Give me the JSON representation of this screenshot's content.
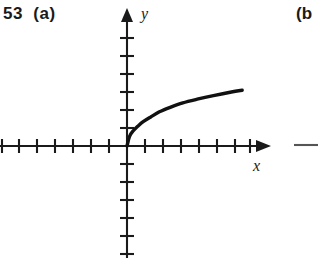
{
  "figure": {
    "problem_number": "53",
    "part_label": "(a)",
    "problem_label_text": "53  (a)",
    "next_part_label": "(b",
    "axis_x_label": "x",
    "axis_y_label": "y",
    "colors": {
      "background": "#ffffff",
      "axis": "#1a1a1a",
      "curve": "#111111",
      "text": "#1a1a1a"
    }
  },
  "chart_data": {
    "type": "line",
    "title": "53 (a)",
    "subtitle": "",
    "xlabel": "x",
    "ylabel": "y",
    "grid": false,
    "legend": null,
    "axis_style": "arrowed-cartesian-axes-with-unit-ticks",
    "origin_px": [
      127,
      146
    ],
    "unit_px": 18,
    "xlim": [
      -7,
      7.5
    ],
    "ylim": [
      -6,
      7.5
    ],
    "x_tick_count_negative": 7,
    "x_tick_count_positive": 7,
    "y_tick_count_positive": 7,
    "y_tick_count_negative": 6,
    "tick_labels_shown": false,
    "series": [
      {
        "name": "y = sqrt(x)",
        "description": "square root curve starting at the origin, increasing and concave down",
        "x": [
          0,
          0.15,
          0.35,
          0.6,
          0.9,
          1.3,
          1.8,
          2.4,
          3.1,
          3.9,
          4.8,
          5.8,
          6.4
        ],
        "y": [
          0,
          0.55,
          0.85,
          1.1,
          1.35,
          1.6,
          1.9,
          2.15,
          2.4,
          2.6,
          2.8,
          3.0,
          3.1
        ]
      }
    ]
  }
}
